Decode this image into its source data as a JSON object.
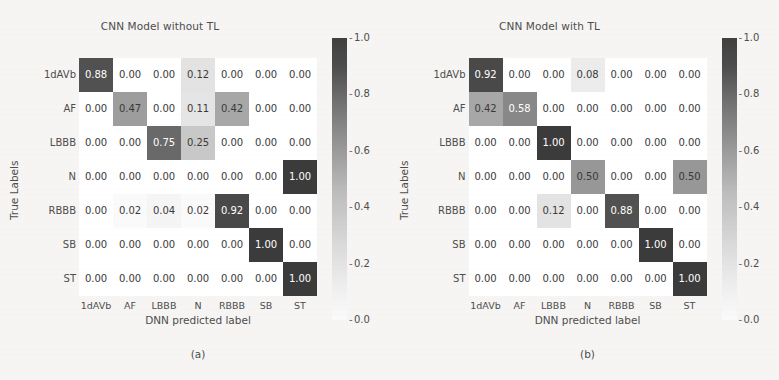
{
  "figure": {
    "background_color": "#f6f5f3",
    "text_color": "#4d4d4d"
  },
  "panels": [
    {
      "title": "CNN Model without TL",
      "caption": "(a)",
      "ylabel": "True Labels",
      "xlabel": "DNN predicted label"
    },
    {
      "title": "CNN Model with TL",
      "caption": "(b)",
      "ylabel": "True Labels",
      "xlabel": "DNN predicted label"
    }
  ],
  "colorbar": {
    "ticks": [
      "1.0",
      "0.8",
      "0.6",
      "0.4",
      "0.2",
      "0.0"
    ],
    "vmin": 0.0,
    "vmax": 1.0,
    "colormap": "gray_r",
    "low_color": "#ffffff",
    "high_color": "#3b3b3b"
  },
  "chart_data": [
    {
      "type": "heatmap",
      "title": "CNN Model without TL",
      "subtitle": "(a)",
      "xlabel": "DNN predicted label",
      "ylabel": "True Labels",
      "categories": [
        "1dAVb",
        "AF",
        "LBBB",
        "N",
        "RBBB",
        "SB",
        "ST"
      ],
      "x": [
        "1dAVb",
        "AF",
        "LBBB",
        "N",
        "RBBB",
        "SB",
        "ST"
      ],
      "y": [
        "1dAVb",
        "AF",
        "LBBB",
        "N",
        "RBBB",
        "SB",
        "ST"
      ],
      "zlim": [
        0.0,
        1.0
      ],
      "grid": false,
      "legend": "colorbar-right",
      "values": [
        [
          0.88,
          0.0,
          0.0,
          0.12,
          0.0,
          0.0,
          0.0
        ],
        [
          0.0,
          0.47,
          0.0,
          0.11,
          0.42,
          0.0,
          0.0
        ],
        [
          0.0,
          0.0,
          0.75,
          0.25,
          0.0,
          0.0,
          0.0
        ],
        [
          0.0,
          0.0,
          0.0,
          0.0,
          0.0,
          0.0,
          1.0
        ],
        [
          0.0,
          0.02,
          0.04,
          0.02,
          0.92,
          0.0,
          0.0
        ],
        [
          0.0,
          0.0,
          0.0,
          0.0,
          0.0,
          1.0,
          0.0
        ],
        [
          0.0,
          0.0,
          0.0,
          0.0,
          0.0,
          0.0,
          1.0
        ]
      ],
      "labels": [
        [
          "0.88",
          "0.00",
          "0.00",
          "0.12",
          "0.00",
          "0.00",
          "0.00"
        ],
        [
          "0.00",
          "0.47",
          "0.00",
          "0.11",
          "0.42",
          "0.00",
          "0.00"
        ],
        [
          "0.00",
          "0.00",
          "0.75",
          "0.25",
          "0.00",
          "0.00",
          "0.00"
        ],
        [
          "0.00",
          "0.00",
          "0.00",
          "0.00",
          "0.00",
          "0.00",
          "1.00"
        ],
        [
          "0.00",
          "0.02",
          "0.04",
          "0.02",
          "0.92",
          "0.00",
          "0.00"
        ],
        [
          "0.00",
          "0.00",
          "0.00",
          "0.00",
          "0.00",
          "1.00",
          "0.00"
        ],
        [
          "0.00",
          "0.00",
          "0.00",
          "0.00",
          "0.00",
          "0.00",
          "1.00"
        ]
      ]
    },
    {
      "type": "heatmap",
      "title": "CNN Model with TL",
      "subtitle": "(b)",
      "xlabel": "DNN predicted label",
      "ylabel": "True Labels",
      "categories": [
        "1dAVb",
        "AF",
        "LBBB",
        "N",
        "RBBB",
        "SB",
        "ST"
      ],
      "x": [
        "1dAVb",
        "AF",
        "LBBB",
        "N",
        "RBBB",
        "SB",
        "ST"
      ],
      "y": [
        "1dAVb",
        "AF",
        "LBBB",
        "N",
        "RBBB",
        "SB",
        "ST"
      ],
      "zlim": [
        0.0,
        1.0
      ],
      "grid": false,
      "legend": "colorbar-right",
      "values": [
        [
          0.92,
          0.0,
          0.0,
          0.08,
          0.0,
          0.0,
          0.0
        ],
        [
          0.42,
          0.58,
          0.0,
          0.0,
          0.0,
          0.0,
          0.0
        ],
        [
          0.0,
          0.0,
          1.0,
          0.0,
          0.0,
          0.0,
          0.0
        ],
        [
          0.0,
          0.0,
          0.0,
          0.5,
          0.0,
          0.0,
          0.5
        ],
        [
          0.0,
          0.0,
          0.12,
          0.0,
          0.88,
          0.0,
          0.0
        ],
        [
          0.0,
          0.0,
          0.0,
          0.0,
          0.0,
          1.0,
          0.0
        ],
        [
          0.0,
          0.0,
          0.0,
          0.0,
          0.0,
          0.0,
          1.0
        ]
      ],
      "labels": [
        [
          "0.92",
          "0.00",
          "0.00",
          "0.08",
          "0.00",
          "0.00",
          "0.00"
        ],
        [
          "0.42",
          "0.58",
          "0.00",
          "0.00",
          "0.00",
          "0.00",
          "0.00"
        ],
        [
          "0.00",
          "0.00",
          "1.00",
          "0.00",
          "0.00",
          "0.00",
          "0.00"
        ],
        [
          "0.00",
          "0.00",
          "0.00",
          "0.50",
          "0.00",
          "0.00",
          "0.50"
        ],
        [
          "0.00",
          "0.00",
          "0.12",
          "0.00",
          "0.88",
          "0.00",
          "0.00"
        ],
        [
          "0.00",
          "0.00",
          "0.00",
          "0.00",
          "0.00",
          "1.00",
          "0.00"
        ],
        [
          "0.00",
          "0.00",
          "0.00",
          "0.00",
          "0.00",
          "0.00",
          "1.00"
        ]
      ]
    }
  ]
}
